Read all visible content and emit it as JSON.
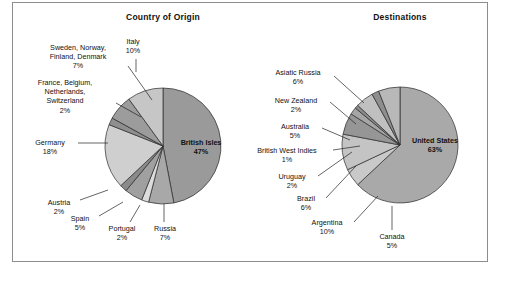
{
  "figure": {
    "background": "#ffffff",
    "frame_color": "#8d8d8d"
  },
  "chart_data": [
    {
      "type": "pie",
      "title": "Country of Origin",
      "xlabel": "",
      "ylabel": "",
      "legend": "none",
      "grid": false,
      "unit": "%",
      "center": [
        163,
        146
      ],
      "radius": 58,
      "start_angle_deg": -90,
      "direction": "clockwise",
      "categories": [
        "British Isles",
        "Russia",
        "Portugal",
        "Spain",
        "Austria",
        "Germany",
        "France, Belgium, Netherlands, Switzerland",
        "Sweden, Norway, Finland, Denmark",
        "Italy"
      ],
      "values": [
        47,
        7,
        2,
        5,
        2,
        18,
        2,
        7,
        10
      ],
      "colors": [
        "#9a9a9a",
        "#a8a8a8",
        "#dcdcdc",
        "#a0a0a0",
        "#8a8a8a",
        "#cfcfcf",
        "#8f8f8f",
        "#9c9c9c",
        "#c6c6c6"
      ],
      "slice_labels": [
        {
          "name": "British Isles",
          "value": "47%",
          "label_line1": "British Isles",
          "label_line2": "47%",
          "placement": "inside"
        },
        {
          "name": "Russia",
          "value": "7%",
          "label_line1": "Russia",
          "label_line2": "7%",
          "placement": "outside"
        },
        {
          "name": "Portugal",
          "value": "2%",
          "label_line1": "Portugal",
          "label_line2": "2%",
          "placement": "outside"
        },
        {
          "name": "Spain",
          "value": "5%",
          "label_line1": "Spain",
          "label_line2": "5%",
          "placement": "outside"
        },
        {
          "name": "Austria",
          "value": "2%",
          "label_line1": "Austria",
          "label_line2": "2%",
          "placement": "outside"
        },
        {
          "name": "Germany",
          "value": "18%",
          "label_line1": "Germany",
          "label_line2": "18%",
          "placement": "outside"
        },
        {
          "name": "France, Belgium, Netherlands, Switzerland",
          "value": "2%",
          "label_line1": "France, Belgium,",
          "label_line2": "Netherlands,",
          "label_line3": "Switzerland",
          "label_line4": "2%",
          "placement": "outside"
        },
        {
          "name": "Sweden, Norway, Finland, Denmark",
          "value": "7%",
          "label_line1": "Sweden, Norway,",
          "label_line2": "Finland, Denmark",
          "label_line3": "7%",
          "placement": "outside"
        },
        {
          "name": "Italy",
          "value": "10%",
          "label_line1": "Italy",
          "label_line2": "10%",
          "placement": "outside"
        }
      ]
    },
    {
      "type": "pie",
      "title": "Destinations",
      "xlabel": "",
      "ylabel": "",
      "legend": "none",
      "grid": false,
      "unit": "%",
      "center": [
        400,
        145
      ],
      "radius": 58,
      "start_angle_deg": -90,
      "direction": "clockwise",
      "categories": [
        "United States",
        "Canada",
        "Argentina",
        "Brazil",
        "Uruguay",
        "British West Indies",
        "Australia",
        "New Zealand",
        "Asiatic Russia"
      ],
      "values": [
        63,
        5,
        10,
        6,
        2,
        1,
        5,
        2,
        6
      ],
      "colors": [
        "#a9a9a9",
        "#c9c9c9",
        "#c4c4c4",
        "#969696",
        "#a6a6a6",
        "#8c8c8c",
        "#c0c0c0",
        "#8e8e8e",
        "#b8b8b8"
      ],
      "slice_labels": [
        {
          "name": "United States",
          "value": "63%",
          "label_line1": "United States",
          "label_line2": "63%",
          "placement": "inside"
        },
        {
          "name": "Canada",
          "value": "5%",
          "label_line1": "Canada",
          "label_line2": "5%",
          "placement": "outside"
        },
        {
          "name": "Argentina",
          "value": "10%",
          "label_line1": "Argentina",
          "label_line2": "10%",
          "placement": "outside"
        },
        {
          "name": "Brazil",
          "value": "6%",
          "label_line1": "Brazil",
          "label_line2": "6%",
          "placement": "outside"
        },
        {
          "name": "Uruguay",
          "value": "2%",
          "label_line1": "Uruguay",
          "label_line2": "2%",
          "placement": "outside"
        },
        {
          "name": "British West Indies",
          "value": "1%",
          "label_line1": "British West Indies",
          "label_line2": "1%",
          "placement": "outside"
        },
        {
          "name": "Australia",
          "value": "5%",
          "label_line1": "Australia",
          "label_line2": "5%",
          "placement": "outside"
        },
        {
          "name": "New Zealand",
          "value": "2%",
          "label_line1": "New Zealand",
          "label_line2": "2%",
          "placement": "outside"
        },
        {
          "name": "Asiatic Russia",
          "value": "6%",
          "label_line1": "Asiatic Russia",
          "label_line2": "6%",
          "placement": "outside"
        }
      ]
    }
  ],
  "labels_left": {
    "sweden": {
      "l1": "Sweden, Norway,",
      "l2": "Finland, Denmark",
      "l3": "7%"
    },
    "italy": {
      "l1": "Italy",
      "l2": "10%"
    },
    "france": {
      "l1": "France, Belgium,",
      "l2": "Netherlands,",
      "l3": "Switzerland",
      "l4": "2%"
    },
    "germany": {
      "l1": "Germany",
      "l2": "18%"
    },
    "austria": {
      "l1": "Austria",
      "l2": "2%"
    },
    "spain": {
      "l1": "Spain",
      "l2": "5%"
    },
    "portugal": {
      "l1": "Portugal",
      "l2": "2%"
    },
    "russia": {
      "l1": "Russia",
      "l2": "7%"
    },
    "british": {
      "l1": "British Isles",
      "l2": "47%"
    }
  },
  "labels_right": {
    "asiatic": {
      "l1": "Asiatic Russia",
      "l2": "6%"
    },
    "nz": {
      "l1": "New Zealand",
      "l2": "2%"
    },
    "australia": {
      "l1": "Australia",
      "l2": "5%"
    },
    "bwi": {
      "l1": "British West Indies",
      "l2": "1%"
    },
    "uruguay": {
      "l1": "Uruguay",
      "l2": "2%"
    },
    "brazil": {
      "l1": "Brazil",
      "l2": "6%"
    },
    "argentina": {
      "l1": "Argentina",
      "l2": "10%"
    },
    "canada": {
      "l1": "Canada",
      "l2": "5%"
    },
    "usa": {
      "l1": "United States",
      "l2": "63%"
    }
  }
}
